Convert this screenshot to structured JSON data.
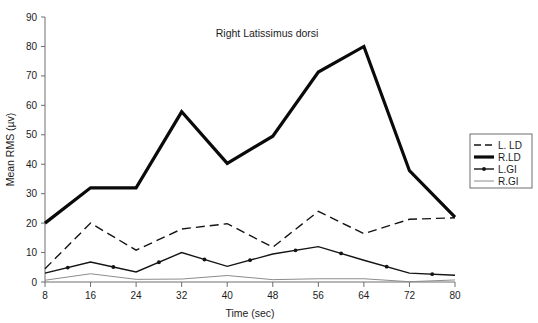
{
  "chart_data": {
    "type": "line",
    "title": "Right Latissimus dorsi",
    "xlabel": "Time (sec)",
    "ylabel": "Mean RMS (µv)",
    "x": [
      8,
      16,
      24,
      32,
      40,
      48,
      56,
      64,
      72,
      80
    ],
    "xticklabels": [
      "8",
      "16",
      "24",
      "32",
      "40",
      "48",
      "56",
      "64",
      "72",
      "80"
    ],
    "yticks": [
      0,
      10,
      20,
      30,
      40,
      50,
      60,
      70,
      80,
      90
    ],
    "yticklabels": [
      "0",
      "10",
      "20",
      "30",
      "40",
      "50",
      "60",
      "70",
      "80",
      "90"
    ],
    "xlim": [
      8,
      80
    ],
    "ylim": [
      0,
      90
    ],
    "grid": false,
    "legend_position": "right-outside",
    "series": [
      {
        "name": "L. LD",
        "style": "dashed",
        "color": "#141414",
        "width": 1.4,
        "markers": false,
        "values": [
          4.5,
          20.0,
          10.8,
          18.0,
          19.8,
          11.8,
          24.0,
          16.4,
          21.3,
          21.8
        ]
      },
      {
        "name": "R.LD",
        "style": "solid-thick",
        "color": "#0a0a0a",
        "width": 3.2,
        "markers": false,
        "values": [
          20.0,
          32.0,
          32.0,
          57.8,
          40.3,
          49.5,
          71.3,
          80.0,
          37.8,
          22.0
        ]
      },
      {
        "name": "L.GI",
        "style": "solid-marker",
        "color": "#141414",
        "width": 1.4,
        "markers": true,
        "values": [
          3.0,
          6.8,
          3.4,
          10.0,
          5.3,
          9.5,
          12.0,
          7.4,
          3.0,
          2.3
        ]
      },
      {
        "name": "R.GI",
        "style": "solid-thin",
        "color": "#8c8c8c",
        "width": 1.0,
        "markers": false,
        "values": [
          0.6,
          2.8,
          0.9,
          1.0,
          2.2,
          0.8,
          1.1,
          1.1,
          0.1,
          0.7
        ]
      }
    ]
  },
  "legend": {
    "entries": [
      "L. LD",
      "R.LD",
      "L.GI",
      "R.GI"
    ]
  }
}
